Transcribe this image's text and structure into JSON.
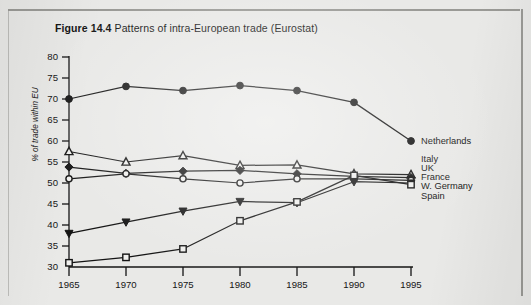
{
  "caption": {
    "figure_number": "Figure 14.4",
    "text": "Patterns of intra-European trade (Eurostat)"
  },
  "chart_data": {
    "type": "line",
    "title": "Patterns of intra-European trade (Eurostat)",
    "xlabel": "",
    "ylabel": "% of trade within EU",
    "x": [
      1965,
      1970,
      1975,
      1980,
      1985,
      1990,
      1995
    ],
    "xtick_labels": [
      "1965",
      "1970",
      "1975",
      "1980",
      "1985",
      "1990",
      "1995"
    ],
    "ytick_labels": [
      "30",
      "35",
      "40",
      "45",
      "50",
      "55",
      "60",
      "65",
      "70",
      "75",
      "80"
    ],
    "ylim": [
      30,
      80
    ],
    "xlim": [
      1965,
      1995
    ],
    "grid": false,
    "legend_position": "right-inline",
    "series": [
      {
        "name": "Netherlands",
        "marker": "filled-circle",
        "values": [
          70.0,
          73.0,
          72.0,
          73.2,
          72.0,
          69.2,
          60.0
        ]
      },
      {
        "name": "Italy",
        "marker": "open-triangle",
        "values": [
          57.5,
          55.0,
          56.5,
          54.2,
          54.3,
          52.2,
          52.0
        ]
      },
      {
        "name": "UK",
        "marker": "filled-diamond",
        "values": [
          53.8,
          52.3,
          52.8,
          53.0,
          52.2,
          51.6,
          51.3
        ]
      },
      {
        "name": "France",
        "marker": "open-circle",
        "values": [
          51.0,
          52.2,
          51.0,
          50.0,
          51.0,
          51.0,
          50.6
        ]
      },
      {
        "name": "W. Germany",
        "marker": "filled-triangle",
        "values": [
          38.0,
          40.7,
          43.3,
          45.6,
          45.3,
          50.3,
          50.0
        ]
      },
      {
        "name": "Spain",
        "marker": "open-square",
        "values": [
          31.0,
          32.3,
          34.3,
          41.0,
          45.5,
          51.8,
          49.6
        ]
      }
    ]
  }
}
